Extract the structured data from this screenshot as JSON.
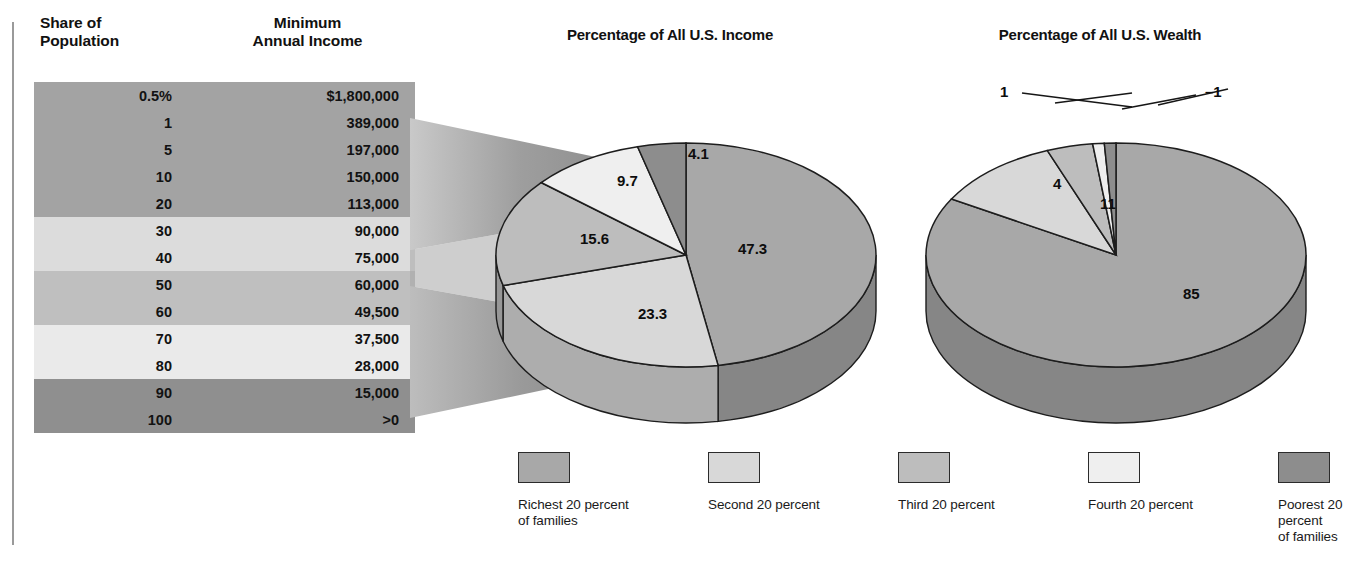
{
  "table": {
    "headers": {
      "share": "Share of\nPopulation",
      "income": "Minimum\nAnnual Income"
    },
    "rows": [
      {
        "share": "0.5%",
        "income": "$1,800,000"
      },
      {
        "share": "1",
        "income": "389,000"
      },
      {
        "share": "5",
        "income": "197,000"
      },
      {
        "share": "10",
        "income": "150,000"
      },
      {
        "share": "20",
        "income": "113,000"
      },
      {
        "share": "30",
        "income": "90,000"
      },
      {
        "share": "40",
        "income": "75,000"
      },
      {
        "share": "50",
        "income": "60,000"
      },
      {
        "share": "60",
        "income": "49,500"
      },
      {
        "share": "70",
        "income": "37,500"
      },
      {
        "share": "80",
        "income": "28,000"
      },
      {
        "share": "90",
        "income": "15,000"
      },
      {
        "share": "100",
        "income": ">0"
      }
    ],
    "bands": [
      {
        "start": 0,
        "count": 5,
        "color": "#a3a3a3"
      },
      {
        "start": 5,
        "count": 2,
        "color": "#dcdcdc"
      },
      {
        "start": 7,
        "count": 2,
        "color": "#bfbfbf"
      },
      {
        "start": 9,
        "count": 2,
        "color": "#eaeaea"
      },
      {
        "start": 11,
        "count": 2,
        "color": "#8f8f8f"
      }
    ]
  },
  "chart_data": [
    {
      "type": "pie",
      "title": "Percentage of All U.S. Income",
      "categories": [
        "Richest 20 percent of families",
        "Second 20 percent",
        "Third 20 percent",
        "Fourth 20 percent",
        "Poorest 20 percent of families"
      ],
      "values": [
        47.3,
        23.3,
        15.6,
        9.7,
        4.1
      ],
      "labels": [
        "47.3",
        "23.3",
        "15.6",
        "9.7",
        "4.1"
      ],
      "colors": [
        "#a8a8a8",
        "#d8d8d8",
        "#bdbdbd",
        "#efefef",
        "#8d8d8d"
      ],
      "legend": "bottom-shared",
      "xlabel": "",
      "ylabel": ""
    },
    {
      "type": "pie",
      "title": "Percentage of All U.S. Wealth",
      "categories": [
        "Richest 20 percent of families",
        "Second 20 percent",
        "Third 20 percent",
        "Fourth 20 percent",
        "Poorest 20 percent of families"
      ],
      "values": [
        85,
        11,
        4,
        1,
        -1
      ],
      "labels": [
        "85",
        "11",
        "4",
        "1",
        "–1"
      ],
      "colors": [
        "#a8a8a8",
        "#d8d8d8",
        "#bdbdbd",
        "#efefef",
        "#8d8d8d"
      ],
      "legend": "bottom-shared",
      "xlabel": "",
      "ylabel": ""
    }
  ],
  "legend": {
    "items": [
      {
        "label": "Richest 20 percent\nof families",
        "color": "#a8a8a8"
      },
      {
        "label": "Second 20 percent",
        "color": "#d8d8d8"
      },
      {
        "label": "Third 20 percent",
        "color": "#bdbdbd"
      },
      {
        "label": "Fourth 20 percent",
        "color": "#efefef"
      },
      {
        "label": "Poorest 20 percent\nof families",
        "color": "#8d8d8d"
      }
    ]
  }
}
